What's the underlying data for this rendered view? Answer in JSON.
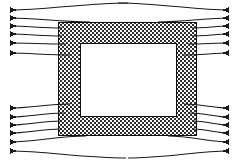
{
  "figure": {
    "title": "Rectangular core frame with converging field lines",
    "background_color": "#ffffff",
    "width": 238,
    "height": 163,
    "stroke_color": "#1a1a1a",
    "hatch_color": "#2b2b2b",
    "hatch_background": "#ffffff",
    "hatch_name": "checkerboard-crosshatch"
  },
  "core": {
    "name": "rectangular-frame-core",
    "outer": {
      "x": 58,
      "y": 22,
      "width": 138,
      "height": 113
    },
    "inner_window": {
      "x": 80,
      "y": 43,
      "width": 96,
      "height": 73
    },
    "fill_pattern": "checkerboard",
    "stroke_color": "#111111",
    "stroke_width": 1
  },
  "flow_groups": [
    {
      "name": "upper-left-inflow",
      "side": "left",
      "direction": "inward",
      "arrow_count": 6,
      "arrow_tip_x": 11,
      "line_color": "#1a1a1a",
      "arrow_tips_y": [
        10,
        18,
        26,
        34,
        43,
        53
      ],
      "entry_points": [
        {
          "x": 128,
          "y": 3
        },
        {
          "x": 90,
          "y": 22
        },
        {
          "x": 62,
          "y": 28
        },
        {
          "x": 62,
          "y": 36
        },
        {
          "x": 66,
          "y": 44
        },
        {
          "x": 70,
          "y": 55
        }
      ]
    },
    {
      "name": "upper-right-outflow",
      "side": "right",
      "direction": "outward",
      "arrow_count": 6,
      "arrow_tip_x": 228,
      "line_color": "#1a1a1a",
      "arrow_tips_y": [
        10,
        18,
        26,
        34,
        43,
        53
      ],
      "entry_points": [
        {
          "x": 118,
          "y": 3
        },
        {
          "x": 158,
          "y": 22
        },
        {
          "x": 192,
          "y": 28
        },
        {
          "x": 192,
          "y": 36
        },
        {
          "x": 188,
          "y": 44
        },
        {
          "x": 184,
          "y": 55
        }
      ]
    },
    {
      "name": "lower-left-inflow",
      "side": "left",
      "direction": "inward",
      "arrow_count": 6,
      "arrow_tip_x": 11,
      "line_color": "#1a1a1a",
      "arrow_tips_y": [
        108,
        117,
        125,
        133,
        142,
        151
      ],
      "entry_points": [
        {
          "x": 70,
          "y": 104
        },
        {
          "x": 64,
          "y": 113
        },
        {
          "x": 61,
          "y": 121
        },
        {
          "x": 61,
          "y": 129
        },
        {
          "x": 86,
          "y": 136
        },
        {
          "x": 126,
          "y": 158
        }
      ]
    },
    {
      "name": "lower-right-outflow",
      "side": "right",
      "direction": "outward",
      "arrow_count": 6,
      "arrow_tip_x": 228,
      "line_color": "#1a1a1a",
      "arrow_tips_y": [
        108,
        117,
        125,
        133,
        142,
        151
      ],
      "entry_points": [
        {
          "x": 184,
          "y": 104
        },
        {
          "x": 190,
          "y": 113
        },
        {
          "x": 193,
          "y": 121
        },
        {
          "x": 193,
          "y": 129
        },
        {
          "x": 168,
          "y": 136
        },
        {
          "x": 128,
          "y": 158
        }
      ]
    }
  ],
  "labels": {
    "figure_caption": "",
    "axis_labels": [],
    "annotations": []
  }
}
